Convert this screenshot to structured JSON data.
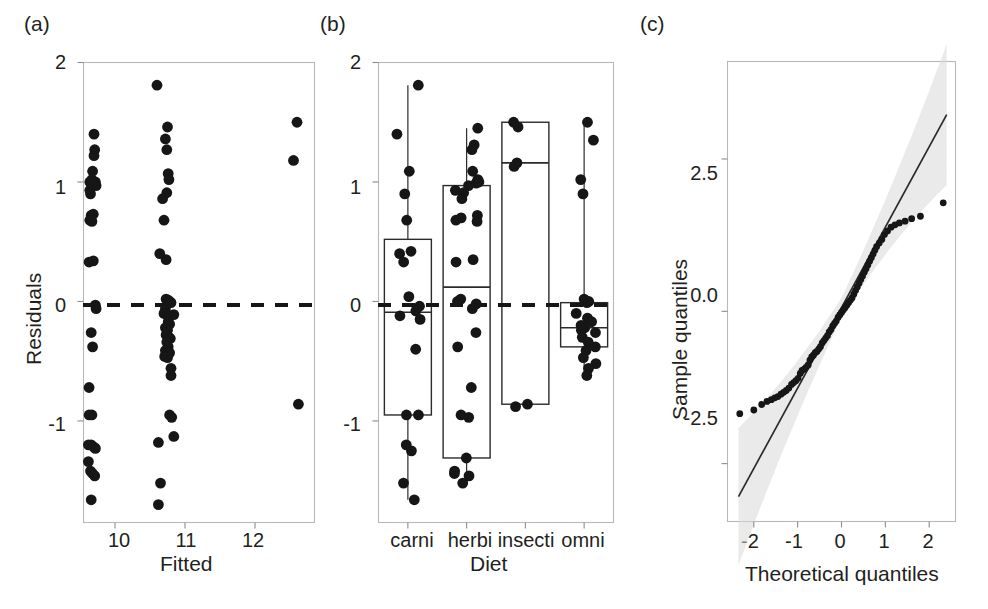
{
  "figure": {
    "width": 988,
    "height": 609,
    "background": "#ffffff",
    "ink_color": "#161616",
    "frame_color": "#b9b8b8"
  },
  "panels": [
    {
      "tag": "(a)",
      "name": "residuals-vs-fitted"
    },
    {
      "tag": "(b)",
      "name": "residuals-by-diet"
    },
    {
      "tag": "(c)",
      "name": "normal-qq-plot"
    }
  ],
  "chart_data": [
    {
      "type": "scatter",
      "panel": "(a)",
      "title": "",
      "xlabel": "Fitted",
      "ylabel": "Residuals",
      "xlim": [
        9.55,
        12.85
      ],
      "ylim": [
        -1.85,
        2.0
      ],
      "xticks": [
        10,
        11,
        12
      ],
      "xtick_labels": [
        "10",
        "11",
        "12"
      ],
      "yticks": [
        -1,
        0,
        1,
        2
      ],
      "ytick_labels": [
        "-1",
        "0",
        "1",
        "2"
      ],
      "grid": false,
      "reference_line": {
        "type": "horizontal",
        "y": 0,
        "style": "dashed"
      },
      "points": [
        [
          9.7,
          1.4
        ],
        [
          9.71,
          1.27
        ],
        [
          9.7,
          1.22
        ],
        [
          9.68,
          1.09
        ],
        [
          9.64,
          1.0
        ],
        [
          9.66,
          0.99
        ],
        [
          9.67,
          1.02
        ],
        [
          9.72,
          1.0
        ],
        [
          9.73,
          0.97
        ],
        [
          9.64,
          0.93
        ],
        [
          9.65,
          0.9
        ],
        [
          9.66,
          0.72
        ],
        [
          9.69,
          0.73
        ],
        [
          9.64,
          0.68
        ],
        [
          9.67,
          0.67
        ],
        [
          9.63,
          0.33
        ],
        [
          9.69,
          0.34
        ],
        [
          9.72,
          -0.03
        ],
        [
          9.73,
          -0.06
        ],
        [
          9.66,
          -0.26
        ],
        [
          9.68,
          -0.38
        ],
        [
          9.63,
          -0.72
        ],
        [
          9.63,
          -0.95
        ],
        [
          9.67,
          -0.95
        ],
        [
          9.62,
          -1.2
        ],
        [
          9.66,
          -1.2
        ],
        [
          9.7,
          -1.22
        ],
        [
          9.72,
          -1.23
        ],
        [
          9.62,
          -1.34
        ],
        [
          9.65,
          -1.42
        ],
        [
          9.68,
          -1.44
        ],
        [
          9.71,
          -1.46
        ],
        [
          9.66,
          -1.66
        ],
        [
          10.6,
          1.81
        ],
        [
          10.75,
          1.46
        ],
        [
          10.72,
          1.36
        ],
        [
          10.74,
          1.27
        ],
        [
          10.76,
          1.07
        ],
        [
          10.77,
          1.02
        ],
        [
          10.74,
          0.91
        ],
        [
          10.68,
          0.86
        ],
        [
          10.7,
          0.68
        ],
        [
          10.64,
          0.4
        ],
        [
          10.73,
          0.35
        ],
        [
          10.73,
          0.02
        ],
        [
          10.76,
          0.01
        ],
        [
          10.78,
          0.0
        ],
        [
          10.8,
          -0.01
        ],
        [
          10.72,
          -0.06
        ],
        [
          10.7,
          -0.1
        ],
        [
          10.74,
          -0.11
        ],
        [
          10.84,
          -0.11
        ],
        [
          10.76,
          -0.17
        ],
        [
          10.78,
          -0.19
        ],
        [
          10.72,
          -0.22
        ],
        [
          10.75,
          -0.24
        ],
        [
          10.73,
          -0.28
        ],
        [
          10.77,
          -0.3
        ],
        [
          10.79,
          -0.31
        ],
        [
          10.74,
          -0.34
        ],
        [
          10.76,
          -0.38
        ],
        [
          10.72,
          -0.41
        ],
        [
          10.78,
          -0.43
        ],
        [
          10.71,
          -0.46
        ],
        [
          10.75,
          -0.47
        ],
        [
          10.8,
          -0.56
        ],
        [
          10.8,
          -0.62
        ],
        [
          10.78,
          -0.95
        ],
        [
          10.81,
          -0.97
        ],
        [
          10.84,
          -1.13
        ],
        [
          10.62,
          -1.18
        ],
        [
          10.65,
          -1.52
        ],
        [
          10.62,
          -1.7
        ],
        [
          12.6,
          1.5
        ],
        [
          12.55,
          1.18
        ],
        [
          12.62,
          -0.86
        ]
      ]
    },
    {
      "type": "box",
      "panel": "(b)",
      "title": "",
      "xlabel": "Diet",
      "ylabel": "",
      "categories": [
        "carni",
        "herbi",
        "insecti",
        "omni"
      ],
      "ylim": [
        -1.85,
        2.0
      ],
      "yticks": [
        -1,
        0,
        1,
        2
      ],
      "ytick_labels": [
        "-1",
        "0",
        "1",
        "2"
      ],
      "grid": false,
      "reference_line": {
        "type": "horizontal",
        "y": 0,
        "style": "dashed"
      },
      "boxes": [
        {
          "category": "carni",
          "q1": -0.95,
          "median": -0.09,
          "q3": 0.52,
          "whisker_low": -1.66,
          "whisker_high": 1.81
        },
        {
          "category": "herbi",
          "q1": -1.31,
          "median": 0.12,
          "q3": 0.97,
          "whisker_low": -1.52,
          "whisker_high": 1.45
        },
        {
          "category": "insecti",
          "q1": -0.86,
          "median": 1.16,
          "q3": 1.5,
          "whisker_low": -0.86,
          "whisker_high": 1.5
        },
        {
          "category": "omni",
          "q1": -0.38,
          "median": -0.22,
          "q3": -0.01,
          "whisker_low": -0.62,
          "whisker_high": 1.5
        }
      ],
      "points": {
        "carni": [
          1.81,
          1.4,
          1.09,
          0.9,
          0.68,
          0.42,
          0.4,
          0.33,
          0.04,
          -0.04,
          -0.08,
          -0.12,
          -0.15,
          -0.4,
          -0.95,
          -0.95,
          -1.2,
          -1.25,
          -1.52,
          -1.66
        ],
        "herbi": [
          1.45,
          1.31,
          1.27,
          1.09,
          1.02,
          1.0,
          0.99,
          0.97,
          0.93,
          0.91,
          0.86,
          0.72,
          0.7,
          0.68,
          0.67,
          0.35,
          0.33,
          0.02,
          0.0,
          -0.02,
          -0.06,
          -0.26,
          -0.38,
          -0.72,
          -0.95,
          -0.97,
          -1.31,
          -1.42,
          -1.44,
          -1.46,
          -1.52
        ],
        "insecti": [
          1.5,
          1.46,
          1.16,
          1.13,
          -0.86,
          -0.88
        ],
        "omni": [
          1.5,
          1.35,
          1.02,
          0.9,
          0.02,
          0.0,
          -0.01,
          -0.1,
          -0.14,
          -0.17,
          -0.2,
          -0.22,
          -0.24,
          -0.26,
          -0.3,
          -0.34,
          -0.38,
          -0.41,
          -0.47,
          -0.52,
          -0.56,
          -0.62
        ]
      }
    },
    {
      "type": "scatter",
      "panel": "(c)",
      "title": "",
      "xlabel": "Theoretical quantiles",
      "ylabel": "Sample quantiles",
      "xlim": [
        -2.6,
        2.6
      ],
      "ylim": [
        -3.45,
        4.1
      ],
      "xticks": [
        -2,
        -1,
        0,
        1,
        2
      ],
      "xtick_labels": [
        "-2",
        "-1",
        "0",
        "1",
        "2"
      ],
      "yticks": [
        -2.5,
        0.0,
        2.5
      ],
      "ytick_labels": [
        "-2.5",
        "0.0",
        "2.5"
      ],
      "grid": false,
      "reference_line": {
        "type": "qq-line",
        "slope": 1.32,
        "intercept": 0.06
      },
      "confidence_band": true,
      "points": [
        [
          -2.32,
          -1.68
        ],
        [
          -2.0,
          -1.62
        ],
        [
          -1.82,
          -1.53
        ],
        [
          -1.7,
          -1.48
        ],
        [
          -1.6,
          -1.45
        ],
        [
          -1.52,
          -1.42
        ],
        [
          -1.45,
          -1.4
        ],
        [
          -1.38,
          -1.36
        ],
        [
          -1.32,
          -1.33
        ],
        [
          -1.26,
          -1.3
        ],
        [
          -1.2,
          -1.26
        ],
        [
          -1.14,
          -1.2
        ],
        [
          -1.09,
          -1.17
        ],
        [
          -1.04,
          -1.14
        ],
        [
          -0.99,
          -1.1
        ],
        [
          -0.94,
          -1.02
        ],
        [
          -0.9,
          -0.97
        ],
        [
          -0.85,
          -0.95
        ],
        [
          -0.81,
          -0.92
        ],
        [
          -0.76,
          -0.88
        ],
        [
          -0.72,
          -0.8
        ],
        [
          -0.68,
          -0.75
        ],
        [
          -0.64,
          -0.72
        ],
        [
          -0.6,
          -0.68
        ],
        [
          -0.56,
          -0.66
        ],
        [
          -0.52,
          -0.62
        ],
        [
          -0.48,
          -0.58
        ],
        [
          -0.44,
          -0.52
        ],
        [
          -0.4,
          -0.48
        ],
        [
          -0.36,
          -0.44
        ],
        [
          -0.32,
          -0.4
        ],
        [
          -0.28,
          -0.34
        ],
        [
          -0.24,
          -0.3
        ],
        [
          -0.2,
          -0.24
        ],
        [
          -0.16,
          -0.2
        ],
        [
          -0.12,
          -0.16
        ],
        [
          -0.08,
          -0.1
        ],
        [
          -0.04,
          -0.06
        ],
        [
          0.0,
          -0.02
        ],
        [
          0.04,
          0.02
        ],
        [
          0.08,
          0.06
        ],
        [
          0.12,
          0.1
        ],
        [
          0.16,
          0.14
        ],
        [
          0.2,
          0.18
        ],
        [
          0.24,
          0.22
        ],
        [
          0.28,
          0.28
        ],
        [
          0.32,
          0.34
        ],
        [
          0.36,
          0.4
        ],
        [
          0.4,
          0.46
        ],
        [
          0.44,
          0.52
        ],
        [
          0.48,
          0.58
        ],
        [
          0.52,
          0.64
        ],
        [
          0.56,
          0.7
        ],
        [
          0.6,
          0.76
        ],
        [
          0.64,
          0.82
        ],
        [
          0.68,
          0.88
        ],
        [
          0.72,
          0.94
        ],
        [
          0.76,
          1.0
        ],
        [
          0.8,
          1.06
        ],
        [
          0.86,
          1.12
        ],
        [
          0.92,
          1.18
        ],
        [
          0.98,
          1.26
        ],
        [
          1.05,
          1.32
        ],
        [
          1.13,
          1.38
        ],
        [
          1.22,
          1.42
        ],
        [
          1.32,
          1.45
        ],
        [
          1.45,
          1.48
        ],
        [
          1.6,
          1.52
        ],
        [
          1.8,
          1.56
        ],
        [
          2.32,
          1.78
        ]
      ]
    }
  ]
}
